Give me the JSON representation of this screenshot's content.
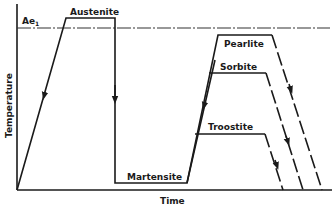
{
  "diagram": {
    "axes": {
      "x_label": "Time",
      "y_label": "Temperature"
    },
    "reference_line": {
      "label": "Ae",
      "subscript": "1"
    },
    "phases": {
      "austenite": "Austenite",
      "martensite": "Martensite",
      "pearlite": "Pearlite",
      "sorbite": "Sorbite",
      "troostite": "Troostite"
    },
    "colors": {
      "ink": "#1a1a1a",
      "background": "#ffffff"
    }
  }
}
